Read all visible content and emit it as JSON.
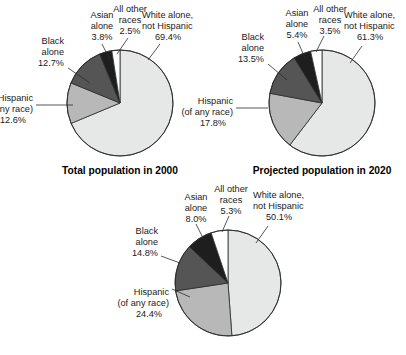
{
  "figure": {
    "title": "",
    "background": "#ffffff"
  },
  "palette": {
    "white_alone": "#e6e8e8",
    "hispanic": "#b8b8b8",
    "black_alone": "#555555",
    "asian_alone": "#1e1e1e",
    "all_other": "#ffffff",
    "outline": "#2b2b2b",
    "text": "#1a1a1a"
  },
  "chart_data": [
    {
      "type": "pie",
      "id": "total-population-2000",
      "title": "Total population in 2000",
      "start_angle_deg": 0,
      "direction": "clockwise",
      "categories": [
        "White alone, not Hispanic",
        "Hispanic (of any race)",
        "Black alone",
        "Asian alone",
        "All other races"
      ],
      "values": [
        69.4,
        12.6,
        12.7,
        3.8,
        2.5
      ],
      "labels": [
        {
          "name": "White alone,",
          "name2": "not Hispanic",
          "value": "69.4%"
        },
        {
          "name": "Hispanic",
          "name2": "(of any race)",
          "value": "12.6%"
        },
        {
          "name": "Black",
          "name2": "alone",
          "value": "12.7%"
        },
        {
          "name": "Asian",
          "name2": "alone",
          "value": "3.8%"
        },
        {
          "name": "All other",
          "name2": "races",
          "value": "2.5%"
        }
      ],
      "colors": [
        "#e6e8e8",
        "#b8b8b8",
        "#555555",
        "#1e1e1e",
        "#ffffff"
      ]
    },
    {
      "type": "pie",
      "id": "projected-population-2020",
      "title": "Projected population in 2020",
      "start_angle_deg": 0,
      "direction": "clockwise",
      "categories": [
        "White alone, not Hispanic",
        "Hispanic (of any race)",
        "Black alone",
        "Asian alone",
        "All other races"
      ],
      "values": [
        61.3,
        17.8,
        13.5,
        5.4,
        3.5
      ],
      "labels": [
        {
          "name": "White alone,",
          "name2": "not Hispanic",
          "value": "61.3%"
        },
        {
          "name": "Hispanic",
          "name2": "(of any race)",
          "value": "17.8%"
        },
        {
          "name": "Black",
          "name2": "alone",
          "value": "13.5%"
        },
        {
          "name": "Asian",
          "name2": "alone",
          "value": "5.4%"
        },
        {
          "name": "All other",
          "name2": "races",
          "value": "3.5%"
        }
      ],
      "colors": [
        "#e6e8e8",
        "#b8b8b8",
        "#555555",
        "#1e1e1e",
        "#ffffff"
      ]
    },
    {
      "type": "pie",
      "id": "projected-population-2050",
      "title": "",
      "start_angle_deg": 0,
      "direction": "clockwise",
      "categories": [
        "White alone, not Hispanic",
        "Hispanic (of any race)",
        "Black alone",
        "Asian alone",
        "All other races"
      ],
      "values": [
        50.1,
        24.4,
        14.8,
        8.0,
        5.3
      ],
      "labels": [
        {
          "name": "White alone,",
          "name2": "not Hispanic",
          "value": "50.1%"
        },
        {
          "name": "Hispanic",
          "name2": "(of any race)",
          "value": "24.4%"
        },
        {
          "name": "Black",
          "name2": "alone",
          "value": "14.8%"
        },
        {
          "name": "Asian",
          "name2": "alone",
          "value": "8.0%"
        },
        {
          "name": "All other",
          "name2": "races",
          "value": "5.3%"
        }
      ],
      "colors": [
        "#e6e8e8",
        "#b8b8b8",
        "#555555",
        "#1e1e1e",
        "#ffffff"
      ]
    }
  ]
}
